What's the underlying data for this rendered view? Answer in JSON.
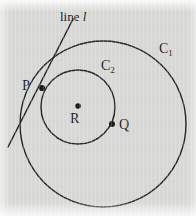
{
  "figure": {
    "type": "geometry-diagram",
    "background_color": "#d8d8d6",
    "stroke_color": "#262626",
    "width": 196,
    "height": 216,
    "labels": {
      "line_label_prefix": "line ",
      "line_label_symbol": "l",
      "circle_large": "C",
      "circle_large_sub": "1",
      "circle_small": "C",
      "circle_small_sub": "2",
      "point_p": "P",
      "point_q": "Q",
      "point_r": "R"
    },
    "shapes": {
      "circle_c1": {
        "cx": 103,
        "cy": 124,
        "r": 83,
        "stroke_width": 1.4
      },
      "circle_c2": {
        "cx": 78,
        "cy": 107,
        "r": 37,
        "stroke_width": 1.4
      },
      "tangent_line": {
        "x1": 73,
        "y1": 19,
        "x2": 8,
        "y2": 147,
        "stroke_width": 1.5
      },
      "leader_line": {
        "x1": 73,
        "y1": 27,
        "x2": 86,
        "y2": 22,
        "stroke_width": 1.0
      }
    },
    "points": [
      {
        "name": "P",
        "cx": 42,
        "cy": 88,
        "r": 3.1,
        "label_position": "left"
      },
      {
        "name": "Q",
        "cx": 112,
        "cy": 124,
        "r": 3.0,
        "label_position": "right"
      },
      {
        "name": "R",
        "cx": 78,
        "cy": 106,
        "r": 2.8,
        "label_position": "below"
      }
    ]
  }
}
